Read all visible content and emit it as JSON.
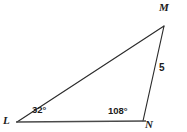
{
  "figure": {
    "kind": "geometry-diagram",
    "shape": "triangle",
    "background_color": "#ffffff",
    "stroke_color": "#2b2b2b",
    "baseline_color": "#4a4a4a",
    "text_color": "#1b1b1b"
  },
  "vertices": {
    "M": {
      "label": "M",
      "x": 164,
      "y": 26
    },
    "L": {
      "label": "L",
      "x": 17,
      "y": 122
    },
    "N": {
      "label": "N",
      "x": 143,
      "y": 121
    }
  },
  "angles": {
    "at_L": {
      "value": "32°",
      "vertex": "L"
    },
    "at_N": {
      "value": "108°",
      "vertex": "N"
    }
  },
  "sides": {
    "MN": {
      "length_label": "5"
    }
  },
  "geometry": {
    "segment_LM": {
      "x1": 17,
      "y1": 122,
      "x2": 164,
      "y2": 26
    },
    "segment_MN": {
      "x1": 164,
      "y1": 26,
      "x2": 143,
      "y2": 121
    },
    "segment_LN": {
      "x1": 16,
      "y1": 122,
      "x2": 146,
      "y2": 121
    }
  }
}
